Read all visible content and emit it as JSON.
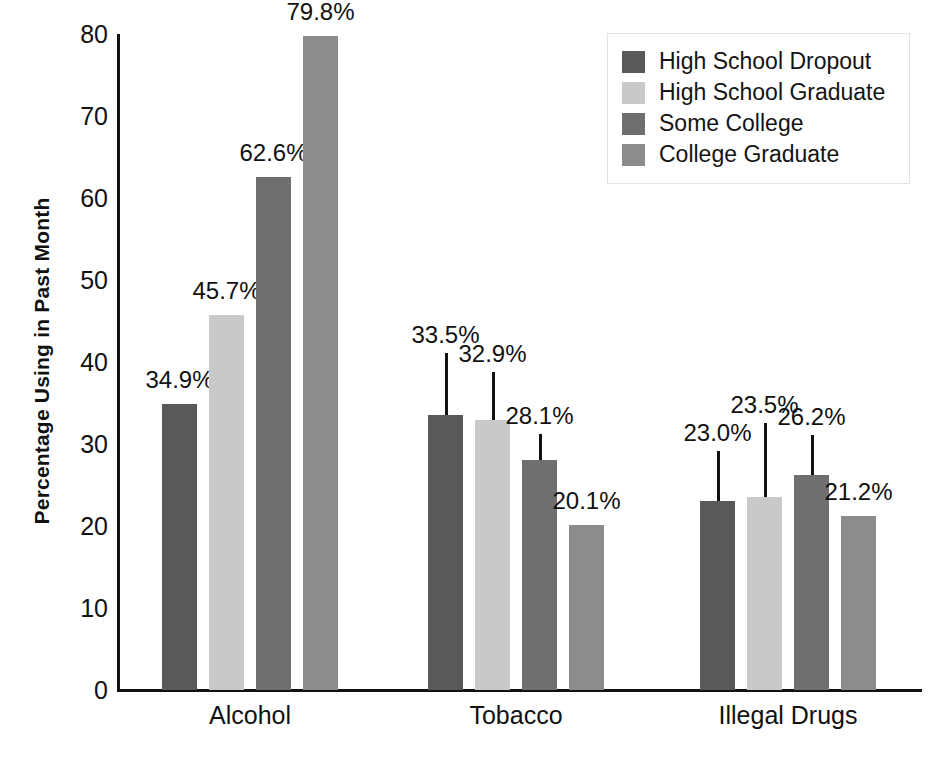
{
  "chart_data": {
    "type": "bar",
    "title": "",
    "subtitle": "",
    "xlabel": "",
    "ylabel": "Percentage Using in Past Month",
    "ylim": [
      0,
      80
    ],
    "yticks": [
      0,
      10,
      20,
      30,
      40,
      50,
      60,
      70,
      80
    ],
    "ytick_labels": [
      "0",
      "10",
      "20",
      "30",
      "40",
      "50",
      "60",
      "70",
      "80"
    ],
    "grid": false,
    "legend_position": "top-right",
    "categories": [
      "Alcohol",
      "Tobacco",
      "Illegal Drugs"
    ],
    "series": [
      {
        "name": "High School Dropout",
        "color": "#595959",
        "values": [
          34.9,
          33.5,
          23.0
        ],
        "labels": [
          "34.9%",
          "33.5%",
          "23.0%"
        ]
      },
      {
        "name": "High School Graduate",
        "color": "#c9c9c9",
        "values": [
          45.7,
          32.9,
          23.5
        ],
        "labels": [
          "45.7%",
          "32.9%",
          "23.5%"
        ]
      },
      {
        "name": "Some College",
        "color": "#6f6f6f",
        "values": [
          62.6,
          28.1,
          26.2
        ],
        "labels": [
          "62.6%",
          "28.1%",
          "26.2%"
        ]
      },
      {
        "name": "College Graduate",
        "color": "#8c8c8c",
        "values": [
          79.8,
          20.1,
          21.2
        ],
        "labels": [
          "79.8%",
          "20.1%",
          "21.2%"
        ]
      }
    ],
    "value_label_offsets": [
      [
        6,
        6,
        6,
        6
      ],
      [
        62,
        48,
        26,
        6
      ],
      [
        50,
        74,
        40,
        6
      ]
    ],
    "axis_color": "#111111",
    "background_color": "#ffffff"
  },
  "legend": {
    "items": [
      {
        "label": "High School Dropout",
        "color": "#595959"
      },
      {
        "label": "High School Graduate",
        "color": "#c9c9c9"
      },
      {
        "label": "Some College",
        "color": "#6f6f6f"
      },
      {
        "label": "College Graduate",
        "color": "#8c8c8c"
      }
    ]
  },
  "axes": {
    "y_title": "Percentage Using in Past Month",
    "y_tick_labels": [
      "80",
      "70",
      "60",
      "50",
      "40",
      "30",
      "20",
      "10",
      "0"
    ],
    "x_tick_labels": [
      "Alcohol",
      "Tobacco",
      "Illegal Drugs"
    ]
  }
}
